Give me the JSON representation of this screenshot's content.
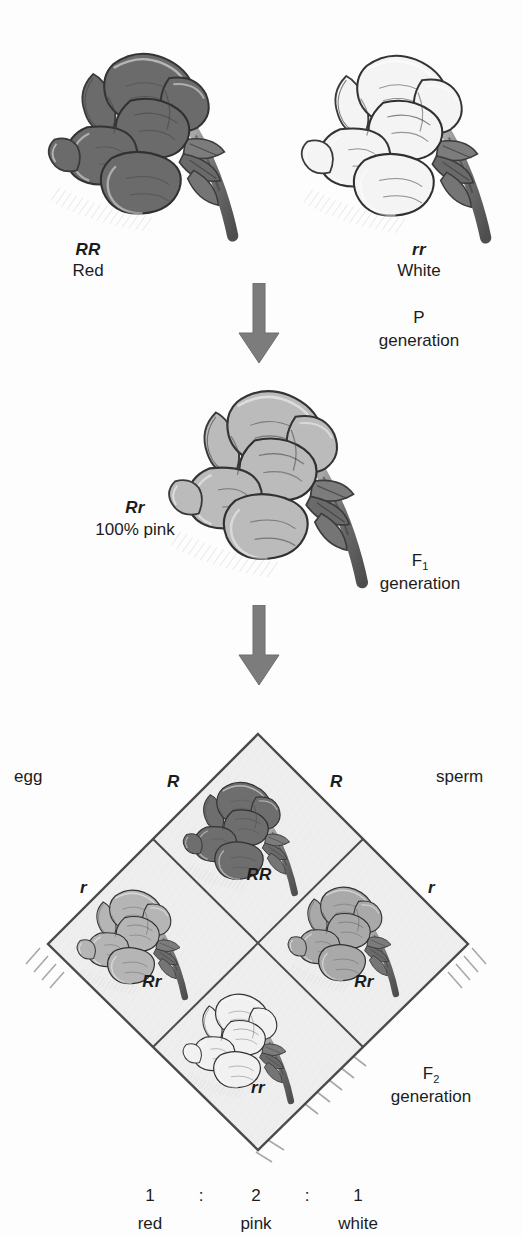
{
  "diagram": {
    "type": "incomplete-dominance-punnett-square",
    "organism": "snapdragon-flower"
  },
  "p_generation": {
    "left_parent": {
      "genotype": "RR",
      "phenotype": "Red",
      "flower_color": "#6b6b6b"
    },
    "right_parent": {
      "genotype": "rr",
      "phenotype": "White",
      "flower_color": "#f2f2f2"
    },
    "generation_line1": "P",
    "generation_line2": "generation"
  },
  "f1_generation": {
    "offspring": {
      "genotype": "Rr",
      "phenotype": "100% pink",
      "flower_color": "#b9b9b9"
    },
    "generation_label": "F",
    "generation_sub": "1",
    "generation_line2": "generation"
  },
  "punnett": {
    "left_axis_label": "egg",
    "right_axis_label": "sperm",
    "top_left_allele": "R",
    "top_right_allele": "R",
    "bottom_left_allele": "r",
    "bottom_right_allele": "r",
    "cells": [
      {
        "position": "top",
        "genotype": "RR",
        "phenotype": "red",
        "flower_color": "#6e6e6e"
      },
      {
        "position": "left",
        "genotype": "Rr",
        "phenotype": "pink",
        "flower_color": "#b5b5b5"
      },
      {
        "position": "right",
        "genotype": "Rr",
        "phenotype": "pink",
        "flower_color": "#b0b0b0"
      },
      {
        "position": "bottom",
        "genotype": "rr",
        "phenotype": "white",
        "flower_color": "#f0f0f0"
      }
    ],
    "fill_color": "#eeeeee",
    "border_color": "#4a4a4a",
    "generation_label": "F",
    "generation_sub": "2",
    "generation_line2": "generation"
  },
  "ratio": {
    "numbers": [
      "1",
      "2",
      "1"
    ],
    "separators": [
      ":",
      ":"
    ],
    "phenotypes": [
      "red",
      "pink",
      "white"
    ]
  },
  "arrows": {
    "color": "#7c7c7c",
    "first_label": "p-to-f1-arrow",
    "second_label": "f1-to-f2-arrow"
  }
}
